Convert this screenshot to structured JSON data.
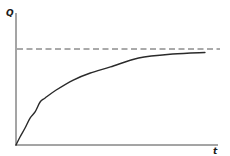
{
  "chart_data": {
    "type": "line",
    "title": "",
    "xlabel": "t",
    "ylabel": "Q",
    "grid": false,
    "legend": null,
    "xlim": [
      0,
      1
    ],
    "ylim": [
      0,
      1.1
    ],
    "x_ticks": [],
    "y_ticks": [],
    "series": [
      {
        "name": "Q(t)",
        "style": "solid",
        "description": "Saturating growth curve rising from origin and approaching asymptote",
        "x": [
          0.0,
          0.02,
          0.045,
          0.07,
          0.095,
          0.12,
          0.145,
          0.2,
          0.285,
          0.37,
          0.47,
          0.61,
          0.78,
          0.94
        ],
        "y": [
          0.0,
          0.083,
          0.177,
          0.281,
          0.344,
          0.448,
          0.49,
          0.573,
          0.677,
          0.75,
          0.813,
          0.906,
          0.948,
          0.964
        ]
      },
      {
        "name": "asymptote",
        "style": "dashed",
        "description": "Horizontal asymptote (maximum Q)",
        "x": [
          0.0,
          1.0
        ],
        "y": [
          1.0,
          1.0
        ]
      }
    ],
    "annotations": []
  },
  "labels": {
    "y_axis": "Q",
    "x_axis": "t"
  },
  "colors": {
    "axis": "#4a4a4a",
    "curve": "#2a2a2a",
    "asymptote": "#555555",
    "background": "#ffffff"
  }
}
